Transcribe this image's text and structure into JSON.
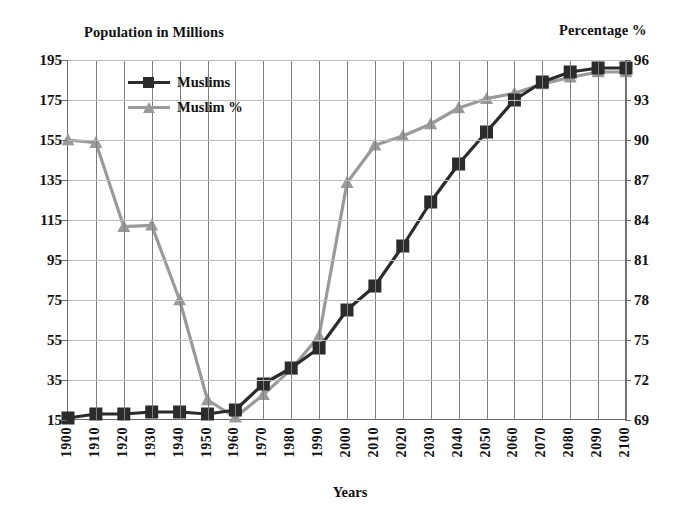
{
  "chart_data": {
    "type": "line",
    "title": "",
    "xlabel": "Years",
    "ylabel": "Population in Millions",
    "y2label": "Percentage %",
    "grid": true,
    "legend_position": "top-left-inside",
    "categories": [
      "1900",
      "1910",
      "1920",
      "1930",
      "1940",
      "1950",
      "1960",
      "1970",
      "1980",
      "1990",
      "2000",
      "2010",
      "2020",
      "2030",
      "2040",
      "2050",
      "2060",
      "2070",
      "2080",
      "2090",
      "2100"
    ],
    "ylim": [
      15,
      195
    ],
    "yticks": [
      15,
      35,
      55,
      75,
      95,
      115,
      135,
      155,
      175,
      195
    ],
    "y2lim": [
      69,
      96
    ],
    "y2ticks": [
      69,
      72,
      75,
      78,
      81,
      84,
      87,
      90,
      93,
      96
    ],
    "series": [
      {
        "name": "Muslims",
        "axis": "left",
        "marker": "square",
        "color": "#2b2b2b",
        "values": [
          16,
          18,
          18,
          19,
          19,
          18,
          20,
          33,
          41,
          51,
          70,
          82,
          102,
          124,
          143,
          159,
          175,
          184,
          189,
          191,
          191
        ]
      },
      {
        "name": "Muslim %",
        "axis": "right",
        "marker": "triangle",
        "color": "#9a9a9a",
        "values": [
          90.0,
          89.8,
          83.5,
          83.6,
          78.0,
          70.5,
          69.2,
          70.9,
          72.8,
          75.3,
          86.8,
          89.6,
          90.3,
          91.2,
          92.4,
          93.1,
          93.5,
          94.2,
          94.7,
          95.1,
          95.1
        ]
      }
    ]
  },
  "legend": {
    "items": [
      {
        "label": "Muslims",
        "marker": "square-marker-icon",
        "color": "#2b2b2b"
      },
      {
        "label": "Muslim %",
        "marker": "triangle-marker-icon",
        "color": "#9a9a9a"
      }
    ]
  },
  "axes": {
    "left_title": "Population in Millions",
    "right_title": "Percentage %",
    "x_title": "Years"
  }
}
